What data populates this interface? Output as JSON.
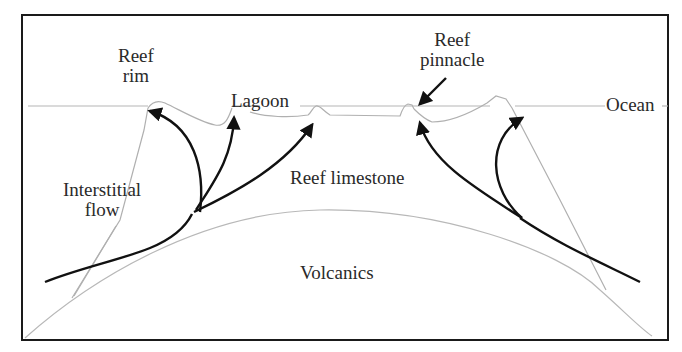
{
  "labels": {
    "reef_rim": [
      "Reef",
      "rim"
    ],
    "lagoon": "Lagoon",
    "reef_pinnacle": [
      "Reef",
      "pinnacle"
    ],
    "ocean": "Ocean",
    "interstitial_flow": [
      "Interstitial",
      "flow"
    ],
    "reef_limestone": "Reef limestone",
    "volcanics": "Volcanics"
  },
  "colors": {
    "frame": "#1a1a1a",
    "outline": "#b0b0b0",
    "arrow": "#111111",
    "text": "#2a2a2a"
  }
}
